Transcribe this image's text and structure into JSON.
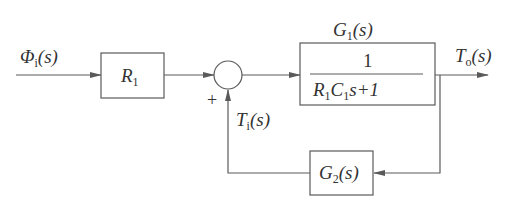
{
  "diagram": {
    "type": "control-block-diagram",
    "colors": {
      "line": "#5a5a5a",
      "text": "#333333",
      "background": "#ffffff"
    },
    "input": {
      "symbol": "Φ",
      "sub": "i",
      "arg": "(s)"
    },
    "output": {
      "symbol": "T",
      "sub": "o",
      "arg": "(s)"
    },
    "feedback_signal": {
      "symbol": "T",
      "sub": "i",
      "arg": "(s)"
    },
    "summing_junction": {
      "sign": "+"
    },
    "blocks": [
      {
        "id": "R1",
        "symbol": "R",
        "sub": "1"
      },
      {
        "id": "G1",
        "label_symbol": "G",
        "label_sub": "1",
        "label_arg": "(s)",
        "numerator": "1",
        "denominator": {
          "R": "R",
          "R_sub": "1",
          "C": "C",
          "C_sub": "1",
          "rest": "s+1"
        }
      },
      {
        "id": "G2",
        "symbol": "G",
        "sub": "2",
        "arg": "(s)"
      }
    ]
  }
}
